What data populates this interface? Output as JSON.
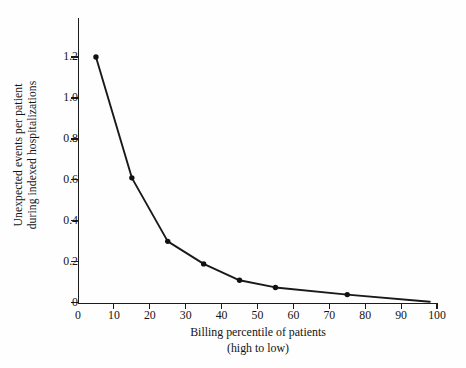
{
  "chart_data": {
    "type": "line",
    "title": "",
    "subtitle": "",
    "xlabel": "Billing percentile of patients",
    "xlabel_line2": "(high to low)",
    "ylabel": "Unexpected events per patient",
    "ylabel_line2": "during indexed hospitalizations",
    "xlim": [
      0,
      100
    ],
    "ylim": [
      0,
      1.3
    ],
    "grid": false,
    "legend_position": "none",
    "x_ticks": [
      0,
      10,
      20,
      30,
      40,
      50,
      60,
      70,
      80,
      90,
      100
    ],
    "x_tick_labels": [
      "0",
      "10",
      "20",
      "30",
      "40",
      "50",
      "60",
      "70",
      "80",
      "90",
      "100"
    ],
    "y_ticks": [
      0,
      0.2,
      0.4,
      0.6,
      0.8,
      1.0,
      1.2
    ],
    "y_tick_labels": [
      "0",
      "0.2",
      "0.4",
      "0.6",
      "0.8",
      "1.0",
      "1.2"
    ],
    "series": [
      {
        "name": "Unexpected events per patient",
        "color": "#191919",
        "marker": "circle",
        "x": [
          5,
          15,
          25,
          35,
          45,
          55,
          75,
          98
        ],
        "values": [
          1.2,
          0.61,
          0.3,
          0.19,
          0.11,
          0.075,
          0.04,
          0.005
        ]
      }
    ],
    "points": [
      {
        "x": 5,
        "y": 1.2
      },
      {
        "x": 15,
        "y": 0.61
      },
      {
        "x": 25,
        "y": 0.3
      },
      {
        "x": 35,
        "y": 0.19
      },
      {
        "x": 45,
        "y": 0.11
      },
      {
        "x": 55,
        "y": 0.075
      },
      {
        "x": 75,
        "y": 0.04
      },
      {
        "x": 98,
        "y": 0.005
      }
    ],
    "annotations": []
  },
  "colors": {
    "line": "#191919",
    "marker": "#111111",
    "axis": "#1b1b1b",
    "text": "#141414",
    "background": "#fefefe"
  }
}
